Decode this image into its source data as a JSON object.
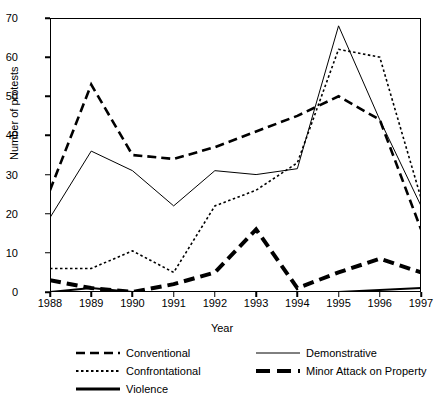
{
  "chart_data": {
    "type": "line",
    "title": "",
    "xlabel": "Year",
    "ylabel": "Number of protests",
    "x": [
      1988,
      1989,
      1990,
      1991,
      1992,
      1993,
      1994,
      1995,
      1996,
      1997
    ],
    "xlim": [
      1988,
      1997
    ],
    "ylim": [
      0,
      70
    ],
    "yticks": [
      0,
      10,
      20,
      30,
      40,
      50,
      60,
      70
    ],
    "xticks": [
      "1988",
      "1989",
      "1990",
      "1991",
      "1992",
      "1993",
      "1994",
      "1995",
      "1996",
      "1997"
    ],
    "grid": false,
    "legend_position": "below-plot",
    "series": [
      {
        "name": "Conventional",
        "style": "dashed",
        "width": 2.6,
        "dash": "9,5",
        "color": "#000000",
        "values": [
          26,
          53,
          35,
          34,
          37,
          41,
          45,
          50,
          44,
          16
        ]
      },
      {
        "name": "Demonstrative",
        "style": "solid-thin",
        "width": 1.0,
        "dash": "",
        "color": "#000000",
        "values": [
          19,
          36,
          31,
          22,
          31,
          30,
          31.5,
          68,
          44,
          22
        ]
      },
      {
        "name": "Confrontational",
        "style": "dotted",
        "width": 1.6,
        "dash": "2.5,2.5",
        "color": "#000000",
        "values": [
          6,
          6,
          10.5,
          5,
          22,
          26,
          33,
          62,
          60,
          24
        ]
      },
      {
        "name": "Minor Attack on Property",
        "style": "thick-dashed",
        "width": 4.0,
        "dash": "11,6",
        "color": "#000000",
        "values": [
          3,
          1,
          0,
          2,
          5,
          16,
          1,
          5,
          8.5,
          5
        ]
      },
      {
        "name": "Violence",
        "style": "thick-solid",
        "width": 2.0,
        "dash": "",
        "color": "#000000",
        "values": [
          0,
          1,
          0,
          0,
          0,
          0,
          0,
          0,
          0.5,
          1
        ]
      }
    ]
  },
  "axes": {
    "ylabel": "Number of protests",
    "xlabel": "Year"
  },
  "legend": {
    "items": [
      {
        "label": "Conventional",
        "series_index": 0
      },
      {
        "label": "Confrontational",
        "series_index": 2
      },
      {
        "label": "Violence",
        "series_index": 4
      },
      {
        "label": "Demonstrative",
        "series_index": 1
      },
      {
        "label": "Minor Attack on Property",
        "series_index": 3
      }
    ]
  }
}
